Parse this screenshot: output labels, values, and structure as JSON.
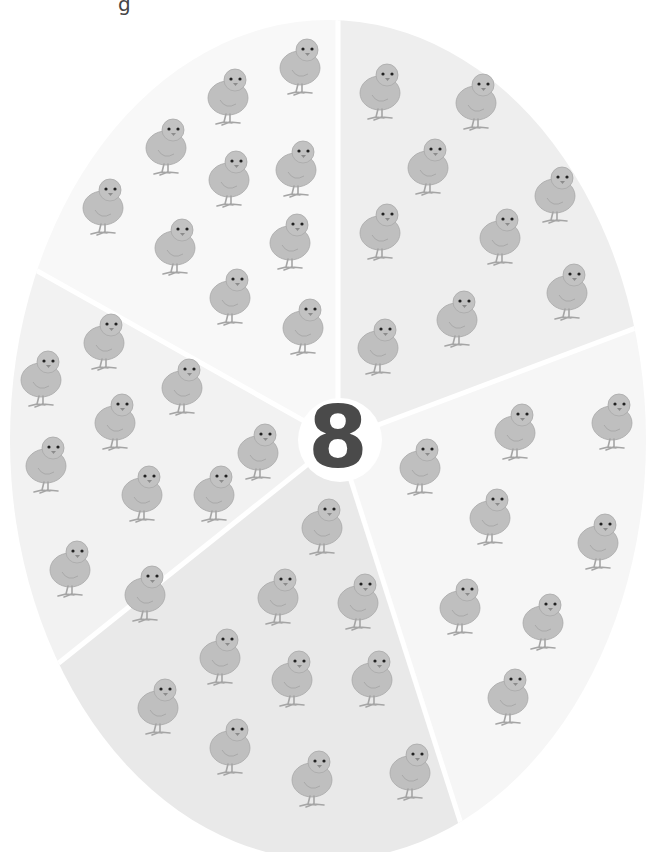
{
  "worksheet": {
    "title_fragment": "g",
    "center_number": "8",
    "colors": {
      "background": "#ffffff",
      "segment_light": "#f4f4f4",
      "segment_mid": "#ececec",
      "segment_dark": "#e4e4e4",
      "divider": "#ffffff",
      "number": "#4a4a4a",
      "chick_body": "#bdbdbd",
      "chick_outline": "#a5a5a5"
    },
    "segments": [
      {
        "name": "top-left",
        "chick_count": 10,
        "fill": "#f7f7f7",
        "chicks": [
          [
            300,
            60
          ],
          [
            228,
            90
          ],
          [
            166,
            140
          ],
          [
            296,
            162
          ],
          [
            229,
            172
          ],
          [
            103,
            200
          ],
          [
            290,
            235
          ],
          [
            175,
            240
          ],
          [
            230,
            290
          ],
          [
            303,
            320
          ]
        ]
      },
      {
        "name": "top-right",
        "chick_count": 10,
        "fill": "#eeeeee",
        "chicks": [
          [
            380,
            85
          ],
          [
            476,
            95
          ],
          [
            428,
            160
          ],
          [
            555,
            188
          ],
          [
            380,
            225
          ],
          [
            500,
            230
          ],
          [
            567,
            285
          ],
          [
            457,
            312
          ],
          [
            378,
            340
          ],
          [
            402,
            0
          ]
        ]
      },
      {
        "name": "right",
        "chick_count": 9,
        "fill": "#f5f5f5",
        "chicks": [
          [
            515,
            425
          ],
          [
            612,
            415
          ],
          [
            420,
            460
          ],
          [
            490,
            510
          ],
          [
            598,
            535
          ],
          [
            460,
            600
          ],
          [
            543,
            615
          ],
          [
            508,
            690
          ],
          [
            610,
            0
          ]
        ]
      },
      {
        "name": "bottom",
        "chick_count": 10,
        "fill": "#e9e9e9",
        "chicks": [
          [
            322,
            520
          ],
          [
            278,
            590
          ],
          [
            358,
            595
          ],
          [
            220,
            650
          ],
          [
            292,
            672
          ],
          [
            372,
            672
          ],
          [
            158,
            700
          ],
          [
            230,
            740
          ],
          [
            312,
            772
          ],
          [
            410,
            765
          ]
        ]
      },
      {
        "name": "left",
        "chick_count": 10,
        "fill": "#f2f2f2",
        "chicks": [
          [
            104,
            335
          ],
          [
            41,
            372
          ],
          [
            182,
            380
          ],
          [
            115,
            415
          ],
          [
            258,
            445
          ],
          [
            46,
            458
          ],
          [
            142,
            487
          ],
          [
            214,
            487
          ],
          [
            70,
            562
          ],
          [
            145,
            587
          ]
        ]
      }
    ]
  }
}
